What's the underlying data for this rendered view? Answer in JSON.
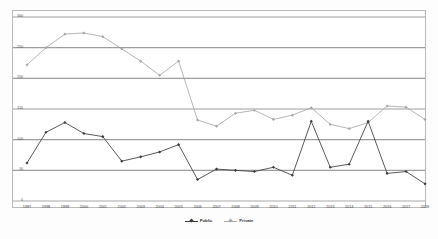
{
  "chart_data": {
    "type": "line",
    "title": "",
    "xlabel": "",
    "ylabel": "",
    "ylim": [
      0,
      300
    ],
    "yticks": [
      0,
      50,
      100,
      150,
      200,
      250,
      300
    ],
    "grid": true,
    "legend_position": "bottom-center",
    "categories": [
      "1997",
      "1998",
      "1999",
      "2000",
      "2001",
      "2002",
      "2003",
      "2004",
      "2005",
      "2006",
      "2007",
      "2008",
      "2009",
      "2010",
      "2011",
      "2012",
      "2013",
      "2014",
      "2015",
      "2016",
      "2017",
      "2018"
    ],
    "series": [
      {
        "name": "Public",
        "color": "#3b3b3b",
        "marker": "diamond",
        "values": [
          62,
          112,
          128,
          110,
          105,
          65,
          72,
          80,
          92,
          35,
          52,
          50,
          48,
          55,
          42,
          130,
          55,
          60,
          130,
          45,
          48,
          28
        ]
      },
      {
        "name": "Private",
        "color": "#a8a8a8",
        "marker": "diamond",
        "values": [
          222,
          250,
          272,
          274,
          268,
          248,
          228,
          205,
          228,
          132,
          122,
          143,
          148,
          133,
          140,
          152,
          125,
          118,
          128,
          155,
          153,
          133
        ]
      }
    ]
  },
  "legend": {
    "items": [
      {
        "label": "Public",
        "color": "#3b3b3b"
      },
      {
        "label": "Private",
        "color": "#a8a8a8"
      }
    ]
  },
  "axes": {
    "y_labels": [
      "300",
      "250",
      "200",
      "150",
      "100",
      "50",
      "0"
    ],
    "x_labels": [
      "1997",
      "1998",
      "1999",
      "2000",
      "2001",
      "2002",
      "2003",
      "2004",
      "2005",
      "2006",
      "2007",
      "2008",
      "2009",
      "2010",
      "2011",
      "2012",
      "2013",
      "2014",
      "2015",
      "2016",
      "2017",
      "2018"
    ]
  }
}
